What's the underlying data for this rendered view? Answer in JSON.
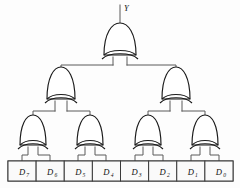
{
  "diagram": {
    "background_color": "#fdfdfd",
    "wire_color": "#5a5a5a",
    "gate_outline_color": "#1b1b1b",
    "gate_fill_color": "#ffffff",
    "box_outline_color": "#3a3a3a",
    "box_fill_color": "#fafafa"
  },
  "output": {
    "label": "Y",
    "name": "output-label-y"
  },
  "gates": [
    {
      "id": "xor-top",
      "type": "XOR",
      "level": 1,
      "cx": 120.0,
      "cy": 44.0
    },
    {
      "id": "xor-mid-l",
      "type": "XOR",
      "level": 2,
      "cx": 61.0,
      "cy": 88.0
    },
    {
      "id": "xor-mid-r",
      "type": "XOR",
      "level": 2,
      "cx": 176.0,
      "cy": 88.0
    },
    {
      "id": "xor-bot-1",
      "type": "XOR",
      "level": 3,
      "cx": 33.0,
      "cy": 136.0
    },
    {
      "id": "xor-bot-2",
      "type": "XOR",
      "level": 3,
      "cx": 90.0,
      "cy": 136.0
    },
    {
      "id": "xor-bot-3",
      "type": "XOR",
      "level": 3,
      "cx": 148.0,
      "cy": 136.0
    },
    {
      "id": "xor-bot-4",
      "type": "XOR",
      "level": 3,
      "cx": 205.0,
      "cy": 136.0
    }
  ],
  "inputs": {
    "count": 8,
    "boxes": [
      {
        "index": 0,
        "base": "D",
        "sub": "7",
        "label": "D7"
      },
      {
        "index": 1,
        "base": "D",
        "sub": "6",
        "label": "D6"
      },
      {
        "index": 2,
        "base": "D",
        "sub": "5",
        "label": "D5"
      },
      {
        "index": 3,
        "base": "D",
        "sub": "4",
        "label": "D4"
      },
      {
        "index": 4,
        "base": "D",
        "sub": "3",
        "label": "D3"
      },
      {
        "index": 5,
        "base": "D",
        "sub": "2",
        "label": "D2"
      },
      {
        "index": 6,
        "base": "D",
        "sub": "1",
        "label": "D1"
      },
      {
        "index": 7,
        "base": "D",
        "sub": "0",
        "label": "D0"
      }
    ]
  }
}
